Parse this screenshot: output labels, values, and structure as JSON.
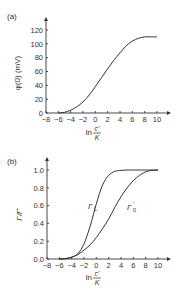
{
  "chart_data": [
    {
      "panel": "(a)",
      "type": "line",
      "xlabel": "ln c'/K",
      "xlabel_main": "ln",
      "xlabel_num": "c'",
      "xlabel_den": "K",
      "ylabel": "φ(0) (mV)",
      "xlim": [
        -8,
        10
      ],
      "ylim": [
        0,
        120
      ],
      "xticks": [
        -8,
        -6,
        -4,
        -2,
        0,
        2,
        4,
        6,
        8,
        10
      ],
      "yticks": [
        0,
        20,
        40,
        60,
        80,
        100,
        120
      ],
      "grid": false,
      "series": [
        {
          "name": "φ(0)",
          "x": [
            -6,
            -5,
            -4,
            -3,
            -2,
            -1,
            0,
            1,
            2,
            3,
            4,
            5,
            6,
            7,
            8,
            9,
            10
          ],
          "y": [
            0,
            1,
            4,
            9,
            16,
            26,
            38,
            51,
            64,
            76,
            87,
            97,
            104,
            108,
            110,
            110,
            110
          ]
        }
      ]
    },
    {
      "panel": "(b)",
      "type": "line",
      "xlabel": "ln c'/K",
      "xlabel_main": "ln",
      "xlabel_num": "c'",
      "xlabel_den": "K",
      "ylabel": "Γ/Γ̂",
      "xlim": [
        -8,
        10
      ],
      "ylim": [
        0,
        1.0
      ],
      "xticks": [
        -8,
        -6,
        -4,
        -2,
        0,
        2,
        4,
        6,
        8,
        10
      ],
      "yticks": [
        "0.0",
        "0.2",
        "0.4",
        "0.6",
        "0.8",
        "1.0"
      ],
      "grid": false,
      "series": [
        {
          "name": "Γ_L",
          "label_main": "Γ",
          "label_sub": "L",
          "x": [
            -6,
            -5,
            -4,
            -3,
            -2,
            -1,
            0,
            1,
            2,
            3,
            4,
            5,
            6,
            8,
            10
          ],
          "y": [
            0,
            0.005,
            0.02,
            0.06,
            0.17,
            0.37,
            0.62,
            0.83,
            0.94,
            0.985,
            0.995,
            1.0,
            1.0,
            1.0,
            1.0
          ]
        },
        {
          "name": "Γ'_0",
          "label_main": "Γ",
          "label_sub": "0",
          "label_sup": "'",
          "x": [
            -6,
            -5,
            -4,
            -3,
            -2,
            -1,
            0,
            1,
            2,
            3,
            4,
            5,
            6,
            7,
            8,
            9,
            10
          ],
          "y": [
            0,
            0.005,
            0.02,
            0.05,
            0.1,
            0.16,
            0.24,
            0.34,
            0.45,
            0.58,
            0.7,
            0.8,
            0.88,
            0.94,
            0.98,
            0.995,
            1.0
          ]
        }
      ]
    }
  ]
}
